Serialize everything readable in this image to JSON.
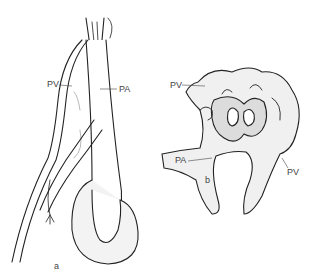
{
  "figure": {
    "panel_a": {
      "label": "a",
      "annotations": [
        {
          "text": "PV",
          "meaning": "pulmonary vein"
        },
        {
          "text": "PA",
          "meaning": "pulmonary artery"
        }
      ]
    },
    "panel_b": {
      "label": "b",
      "annotations": [
        {
          "text": "PV"
        },
        {
          "text": "PA"
        },
        {
          "text": "PV"
        }
      ]
    },
    "colors": {
      "line": "#222222",
      "shade": "#9a9a9a",
      "background": "#ffffff"
    }
  }
}
